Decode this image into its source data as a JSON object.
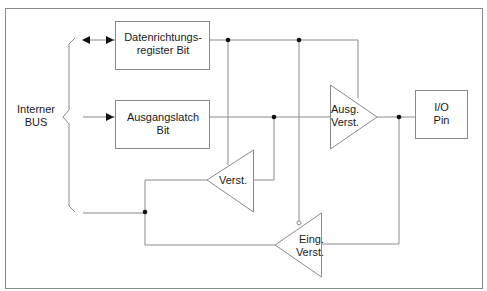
{
  "diagram": {
    "bus_label_line1": "Interner",
    "bus_label_line2": "BUS",
    "blocks": {
      "direction_register": {
        "line1": "Datenrichtungs-",
        "line2": "register Bit"
      },
      "output_latch": {
        "line1": "Ausgangslatch",
        "line2": "Bit"
      },
      "io_pin": {
        "line1": "I/O",
        "line2": "Pin"
      }
    },
    "amplifiers": {
      "output_amp": {
        "line1": "Ausg.",
        "line2": "Verst."
      },
      "read_amp": {
        "line1": "Verst."
      },
      "input_amp": {
        "line1": "Eing.",
        "line2": "Verst."
      }
    },
    "colors": {
      "line": "#8a8a8a",
      "junction": "#111111",
      "text": "#1a1a1a"
    }
  }
}
